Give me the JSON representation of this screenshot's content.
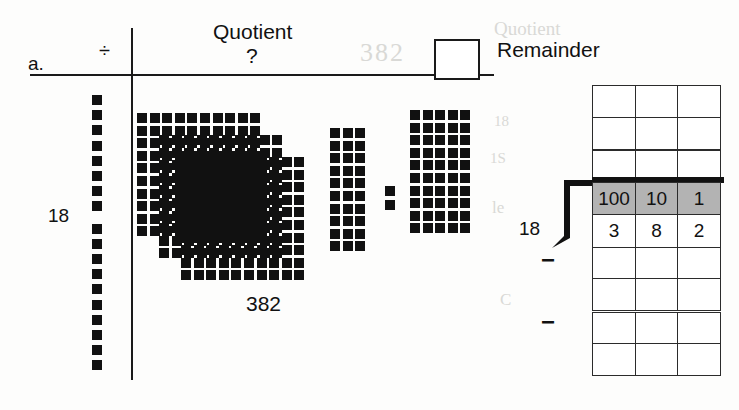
{
  "page": {
    "item_label": "a.",
    "divide_symbol": "÷",
    "quotient_label": "Quotient",
    "quotient_value": "?",
    "remainder_label": "Remainder",
    "divisor_label_blocks": "18",
    "dividend_label_blocks": "382",
    "divisor_label_table": "18",
    "answer_box_value": "",
    "minus_signs": [
      "−",
      "−"
    ]
  },
  "blocks": {
    "divisor_strip": {
      "name": "18",
      "count": 18,
      "group_a_count": 8,
      "group_b_count": 10
    },
    "hundreds_flats": {
      "count": 3,
      "rows": 10,
      "cols": 10,
      "value": 300
    },
    "tens_left": {
      "count": 3,
      "rows": 10,
      "value": 30
    },
    "ones": {
      "count": 2,
      "value": 2
    },
    "tens_right": {
      "count": 5,
      "rows": 10,
      "value": 50
    }
  },
  "place_value_table": {
    "headers": [
      "100",
      "10",
      "1"
    ],
    "digits": [
      "3",
      "8",
      "2"
    ],
    "empty_rows_above": 3,
    "empty_rows_below": 4
  },
  "colors": {
    "ink": "#111111",
    "rule": "#1a1a1a",
    "grid": "#2b2b2b",
    "shade": "#b3b3b3",
    "paper": "#fdfdfc"
  },
  "bleed_text": [
    "Quotient",
    "382",
    "18",
    "le",
    "1S",
    "C"
  ]
}
